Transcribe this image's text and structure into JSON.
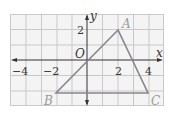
{
  "figure": {
    "axes": {
      "x_label": "x",
      "y_label": "y",
      "origin_label": "O",
      "x_ticks": [
        {
          "value": -4,
          "label": "−4"
        },
        {
          "value": -2,
          "label": "−2"
        },
        {
          "value": 2,
          "label": "2"
        },
        {
          "value": 4,
          "label": "4"
        }
      ],
      "y_ticks": [
        {
          "value": 2,
          "label": "2"
        }
      ]
    },
    "triangle": {
      "vertices": [
        {
          "name": "A",
          "x": 2,
          "y": 2
        },
        {
          "name": "B",
          "x": -2,
          "y": -3
        },
        {
          "name": "C",
          "x": 4,
          "y": -3
        }
      ],
      "color": "#8c8490"
    },
    "grid": {
      "x_min": -5,
      "x_max": 5,
      "y_min": -3,
      "y_max": 3,
      "color": "#c8c8c8"
    }
  }
}
